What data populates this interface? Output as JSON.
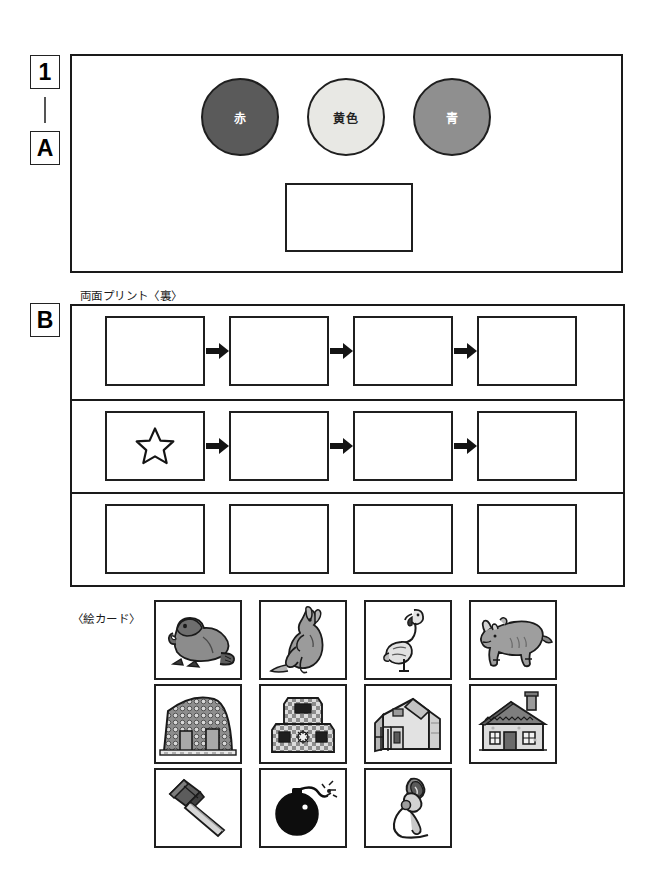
{
  "page": {
    "ink_color": "#1a1a1a",
    "paper_color": "#ffffff"
  },
  "tags": {
    "number": "1",
    "dash": "|",
    "section_a": "A",
    "section_b": "B"
  },
  "section_a": {
    "label": "両面プリント〈表〉",
    "circles": [
      {
        "name": "red",
        "label": "赤",
        "fill": "#5a5a5a",
        "text_color": "#ffffff",
        "stroke": "#1f1f1f"
      },
      {
        "name": "yellow",
        "label": "黄色",
        "fill": "#e8e8e4",
        "text_color": "#222222",
        "stroke": "#1f1f1f"
      },
      {
        "name": "blue",
        "label": "青",
        "fill": "#8f8f8f",
        "text_color": "#ffffff",
        "stroke": "#1f1f1f"
      }
    ],
    "answer_slot": {
      "name": "answer-slot",
      "value": ""
    }
  },
  "section_b": {
    "label": "両面プリント〈裏〉",
    "rows": [
      {
        "name": "sequence-row-1",
        "has_arrows": true,
        "cells": [
          {
            "content": "",
            "icon": "none"
          },
          {
            "content": "",
            "icon": "none"
          },
          {
            "content": "",
            "icon": "none"
          },
          {
            "content": "",
            "icon": "none"
          }
        ]
      },
      {
        "name": "sequence-row-2",
        "has_arrows": true,
        "cells": [
          {
            "content": "",
            "icon": "star"
          },
          {
            "content": "",
            "icon": "none"
          },
          {
            "content": "",
            "icon": "none"
          },
          {
            "content": "",
            "icon": "none"
          }
        ]
      },
      {
        "name": "sequence-row-3",
        "has_arrows": false,
        "cells": [
          {
            "content": "",
            "icon": "none"
          },
          {
            "content": "",
            "icon": "none"
          },
          {
            "content": "",
            "icon": "none"
          },
          {
            "content": "",
            "icon": "none"
          }
        ]
      }
    ],
    "arrow_icon": "arrow-right-icon"
  },
  "picture_cards": {
    "label": "〈絵カード〉",
    "rows": [
      [
        {
          "icon": "beaver-icon",
          "alt": "ビーバー"
        },
        {
          "icon": "kangaroo-icon",
          "alt": "カンガルー"
        },
        {
          "icon": "flamingo-icon",
          "alt": "フラミンゴ"
        },
        {
          "icon": "rhinoceros-icon",
          "alt": "サイ"
        }
      ],
      [
        {
          "icon": "stone-house-icon",
          "alt": "石の家"
        },
        {
          "icon": "tiled-tower-icon",
          "alt": "タイルの建物"
        },
        {
          "icon": "modern-building-icon",
          "alt": "近代的な建物"
        },
        {
          "icon": "cottage-icon",
          "alt": "一軒家"
        }
      ],
      [
        {
          "icon": "mallet-icon",
          "alt": "木槌"
        },
        {
          "icon": "bomb-icon",
          "alt": "爆弾"
        },
        {
          "icon": "microphone-icon",
          "alt": "マイク"
        }
      ]
    ]
  }
}
